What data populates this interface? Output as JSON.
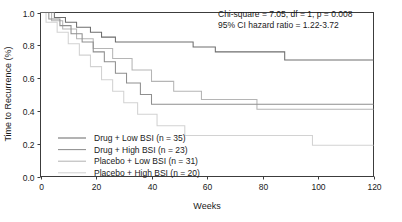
{
  "chart_data": {
    "type": "line",
    "subtype": "kaplan-meier-step",
    "title": "",
    "xlabel": "Weeks",
    "ylabel": "Time to Recurrence (%)",
    "xlim": [
      0,
      120
    ],
    "ylim": [
      0.0,
      1.0
    ],
    "xticks": [
      0,
      20,
      40,
      60,
      80,
      100,
      120
    ],
    "yticks": [
      0.0,
      0.2,
      0.4,
      0.6,
      0.8,
      1.0
    ],
    "ytick_labels": [
      "0.0",
      "0.2",
      "0.4",
      "0.6",
      "0.8",
      "1.0"
    ],
    "xtick_labels": [
      "0",
      "20",
      "40",
      "60",
      "80",
      "100",
      "120"
    ],
    "grid": false,
    "legend_position": "lower-left-inside",
    "annotations": [
      "Chi-square = 7.05, df = 1, p = 0.008",
      "95% CI hazard ratio = 1.22-3.72"
    ],
    "series": [
      {
        "name": "Drug + Low BSI (n = 35)",
        "label": "Drug + Low BSI",
        "n": 35,
        "color": "#6e6e6e",
        "final_value": 0.71,
        "points": [
          [
            0,
            1.0
          ],
          [
            5,
            1.0
          ],
          [
            5,
            0.97
          ],
          [
            9,
            0.97
          ],
          [
            9,
            0.94
          ],
          [
            13,
            0.94
          ],
          [
            13,
            0.91
          ],
          [
            18,
            0.91
          ],
          [
            18,
            0.88
          ],
          [
            22,
            0.88
          ],
          [
            22,
            0.85
          ],
          [
            27,
            0.85
          ],
          [
            27,
            0.82
          ],
          [
            55,
            0.82
          ],
          [
            55,
            0.79
          ],
          [
            63,
            0.79
          ],
          [
            63,
            0.76
          ],
          [
            88,
            0.76
          ],
          [
            88,
            0.71
          ],
          [
            120,
            0.71
          ]
        ]
      },
      {
        "name": "Drug + High BSI (n = 23)",
        "label": "Drug + High BSI",
        "n": 23,
        "color": "#8f8f8f",
        "final_value": 0.44,
        "points": [
          [
            0,
            1.0
          ],
          [
            3,
            1.0
          ],
          [
            3,
            0.96
          ],
          [
            7,
            0.96
          ],
          [
            7,
            0.92
          ],
          [
            11,
            0.92
          ],
          [
            11,
            0.87
          ],
          [
            15,
            0.87
          ],
          [
            15,
            0.82
          ],
          [
            19,
            0.82
          ],
          [
            19,
            0.76
          ],
          [
            23,
            0.76
          ],
          [
            23,
            0.7
          ],
          [
            27,
            0.7
          ],
          [
            27,
            0.63
          ],
          [
            31,
            0.63
          ],
          [
            31,
            0.57
          ],
          [
            36,
            0.57
          ],
          [
            36,
            0.5
          ],
          [
            40,
            0.5
          ],
          [
            40,
            0.44
          ],
          [
            120,
            0.44
          ]
        ]
      },
      {
        "name": "Placebo + Low BSI (n = 31)",
        "label": "Placebo + Low BSI",
        "n": 31,
        "color": "#b5b5b5",
        "final_value": 0.41,
        "points": [
          [
            0,
            1.0
          ],
          [
            4,
            1.0
          ],
          [
            4,
            0.95
          ],
          [
            8,
            0.95
          ],
          [
            8,
            0.9
          ],
          [
            13,
            0.9
          ],
          [
            13,
            0.84
          ],
          [
            19,
            0.84
          ],
          [
            19,
            0.78
          ],
          [
            26,
            0.78
          ],
          [
            26,
            0.72
          ],
          [
            33,
            0.72
          ],
          [
            33,
            0.65
          ],
          [
            40,
            0.65
          ],
          [
            40,
            0.58
          ],
          [
            48,
            0.58
          ],
          [
            48,
            0.52
          ],
          [
            58,
            0.52
          ],
          [
            58,
            0.47
          ],
          [
            78,
            0.47
          ],
          [
            78,
            0.41
          ],
          [
            120,
            0.41
          ]
        ]
      },
      {
        "name": "Placebo + High BSI (n = 20)",
        "label": "Placebo + High BSI",
        "n": 20,
        "color": "#d2d2d2",
        "final_value": 0.19,
        "points": [
          [
            0,
            1.0
          ],
          [
            2,
            1.0
          ],
          [
            2,
            0.94
          ],
          [
            6,
            0.94
          ],
          [
            6,
            0.88
          ],
          [
            10,
            0.88
          ],
          [
            10,
            0.81
          ],
          [
            14,
            0.81
          ],
          [
            14,
            0.74
          ],
          [
            18,
            0.74
          ],
          [
            18,
            0.67
          ],
          [
            22,
            0.67
          ],
          [
            22,
            0.59
          ],
          [
            26,
            0.59
          ],
          [
            26,
            0.52
          ],
          [
            30,
            0.52
          ],
          [
            30,
            0.45
          ],
          [
            35,
            0.45
          ],
          [
            35,
            0.38
          ],
          [
            42,
            0.38
          ],
          [
            42,
            0.31
          ],
          [
            52,
            0.31
          ],
          [
            52,
            0.25
          ],
          [
            98,
            0.25
          ],
          [
            98,
            0.19
          ],
          [
            120,
            0.19
          ]
        ]
      }
    ]
  },
  "legend": {
    "entries": [
      {
        "label": "Drug + Low BSI (n = 35)"
      },
      {
        "label": "Drug + High BSI (n = 23)"
      },
      {
        "label": "Placebo + Low BSI (n = 31)"
      },
      {
        "label": "Placebo + High BSI (n = 20)"
      }
    ]
  },
  "axes": {
    "x_title": "Weeks",
    "y_title": "Time to Recurrence (%)",
    "x_tick_labels": [
      "0",
      "20",
      "40",
      "60",
      "80",
      "100",
      "120"
    ],
    "y_tick_labels": [
      "0.0",
      "0.2",
      "0.4",
      "0.6",
      "0.8",
      "1.0"
    ]
  },
  "stats": {
    "line1": "Chi-square = 7.05, df = 1, p = 0.008",
    "line2": "95% CI hazard ratio = 1.22-3.72"
  },
  "colors": {
    "series1": "#6e6e6e",
    "series2": "#8f8f8f",
    "series3": "#b5b5b5",
    "series4": "#d2d2d2",
    "axis": "#3c3c3c",
    "text": "#1a1a1a",
    "background": "#ffffff"
  }
}
